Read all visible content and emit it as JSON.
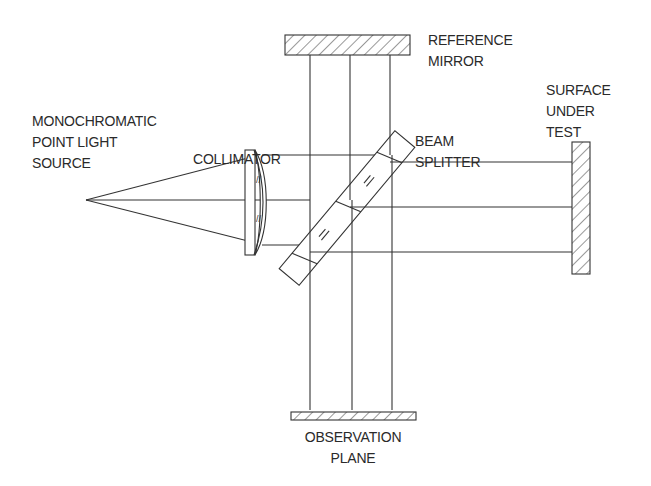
{
  "diagram": {
    "type": "optical-schematic",
    "labels": {
      "source_line1": "MONOCHROMATIC",
      "source_line2": "POINT LIGHT",
      "source_line3": "SOURCE",
      "collimator": "COLLIMATOR",
      "reference_line1": "REFERENCE",
      "reference_line2": "MIRROR",
      "beam_line1": "BEAM",
      "beam_line2": "SPLITTER",
      "surface_line1": "SURFACE",
      "surface_line2": "UNDER",
      "surface_line3": "TEST",
      "observation_line1": "OBSERVATION",
      "observation_line2": "PLANE"
    },
    "components": [
      {
        "id": "point-source",
        "position": [
          86,
          200
        ]
      },
      {
        "id": "collimator-lens",
        "position": [
          248,
          200
        ]
      },
      {
        "id": "beam-splitter",
        "angle_deg": 45,
        "center": [
          345,
          211
        ]
      },
      {
        "id": "reference-mirror",
        "orientation": "horizontal",
        "top": true
      },
      {
        "id": "surface-under-test",
        "orientation": "vertical",
        "right": true
      },
      {
        "id": "observation-plane",
        "orientation": "horizontal",
        "bottom": true
      }
    ],
    "rays": {
      "count": 3,
      "horizontal_y": [
        155,
        200,
        245
      ],
      "vertical_x": [
        310,
        350,
        390
      ]
    }
  }
}
